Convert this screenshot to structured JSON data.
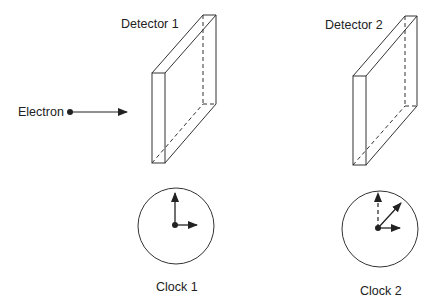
{
  "diagram": {
    "colors": {
      "line": "#333333",
      "text": "#222222",
      "background": "#ffffff"
    },
    "particle": {
      "label": "Electron",
      "icon": "arrow-right-icon"
    },
    "detectors": [
      {
        "label": "Detector 1"
      },
      {
        "label": "Detector 2"
      }
    ],
    "clocks": [
      {
        "label": "Clock 1",
        "hands": [
          "up (12 o'clock)",
          "right (3 o'clock)"
        ]
      },
      {
        "label": "Clock 2",
        "hands": [
          "up dashed (12 o'clock, reference)",
          "diagonal (~1:30)",
          "right (3 o'clock)"
        ]
      }
    ]
  }
}
